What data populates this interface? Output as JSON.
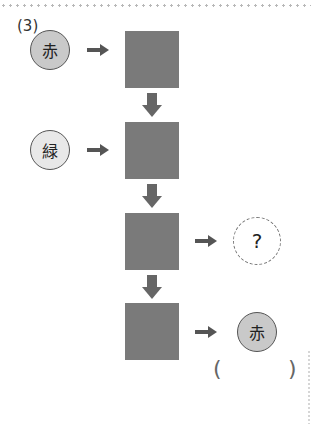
{
  "problem": {
    "label": "(3)",
    "inputs": [
      {
        "text": "赤",
        "meaning": "red"
      },
      {
        "text": "緑",
        "meaning": "green"
      }
    ],
    "unknown_output": {
      "text": "?"
    },
    "final_output": {
      "text": "赤"
    },
    "answer_blank": {
      "open": "(",
      "close": ")"
    },
    "boxes": 4
  },
  "colors": {
    "box_fill": "#7a7a7a",
    "arrow": "#555555",
    "red_circle_fill": "#c9c9c9",
    "green_circle_fill": "#e8e8e8",
    "circle_stroke": "#555555",
    "dotted_rule": "#b8b8b8"
  }
}
